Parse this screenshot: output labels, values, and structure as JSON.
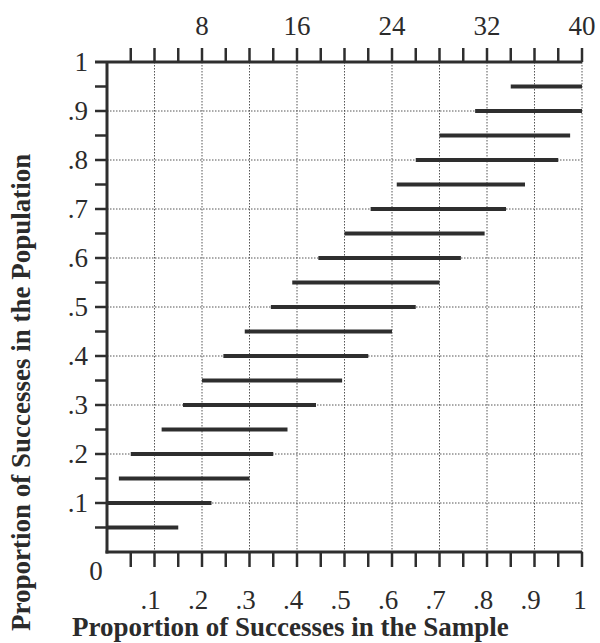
{
  "chart_data": {
    "type": "interval",
    "title": "",
    "xlabel": "Proportion of Successes in the Sample",
    "ylabel": "Proportion of Successes in the Population",
    "xlim": [
      0,
      1
    ],
    "ylim": [
      0,
      1
    ],
    "grid": true,
    "x_ticks": [
      ".1",
      ".2",
      ".3",
      ".4",
      ".5",
      ".6",
      ".7",
      ".8",
      ".9",
      "1"
    ],
    "y_ticks": [
      "0",
      ".1",
      ".2",
      ".3",
      ".4",
      ".5",
      ".6",
      ".7",
      ".8",
      ".9",
      "1"
    ],
    "top_axis": {
      "label": "Number of Successes (n = 40)",
      "range": [
        0,
        40
      ],
      "ticks": [
        "8",
        "16",
        "24",
        "32",
        "40"
      ]
    },
    "series": [
      {
        "name": "Acceptance intervals",
        "intervals": [
          {
            "p": 0.05,
            "low": 0.0,
            "high": 0.15
          },
          {
            "p": 0.1,
            "low": 0.0,
            "high": 0.22
          },
          {
            "p": 0.15,
            "low": 0.025,
            "high": 0.3
          },
          {
            "p": 0.2,
            "low": 0.05,
            "high": 0.35
          },
          {
            "p": 0.25,
            "low": 0.115,
            "high": 0.38
          },
          {
            "p": 0.3,
            "low": 0.16,
            "high": 0.44
          },
          {
            "p": 0.35,
            "low": 0.2,
            "high": 0.495
          },
          {
            "p": 0.4,
            "low": 0.245,
            "high": 0.55
          },
          {
            "p": 0.45,
            "low": 0.29,
            "high": 0.6
          },
          {
            "p": 0.5,
            "low": 0.345,
            "high": 0.65
          },
          {
            "p": 0.55,
            "low": 0.39,
            "high": 0.7
          },
          {
            "p": 0.6,
            "low": 0.445,
            "high": 0.745
          },
          {
            "p": 0.65,
            "low": 0.5,
            "high": 0.795
          },
          {
            "p": 0.7,
            "low": 0.555,
            "high": 0.84
          },
          {
            "p": 0.75,
            "low": 0.61,
            "high": 0.88
          },
          {
            "p": 0.8,
            "low": 0.65,
            "high": 0.95
          },
          {
            "p": 0.85,
            "low": 0.7,
            "high": 0.975
          },
          {
            "p": 0.9,
            "low": 0.775,
            "high": 1.0
          },
          {
            "p": 0.95,
            "low": 0.85,
            "high": 1.0
          }
        ]
      }
    ]
  },
  "labels": {
    "xlabel": "Proportion of Successes in the Sample",
    "ylabel": "Proportion of Successes in the Population"
  },
  "colors": {
    "bar": "#2e2e2e",
    "axis": "#2e2e2e",
    "grid": "#555555"
  }
}
